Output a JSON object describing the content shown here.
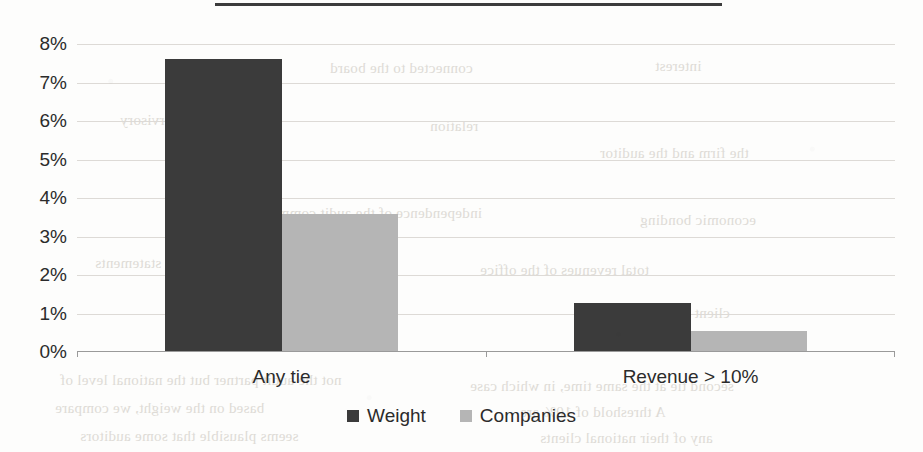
{
  "page": {
    "background_color": "#fdfdfc",
    "top_rule_color": "#3c3c3c"
  },
  "bleed_through": [
    {
      "text": "connected to the board",
      "x": 330,
      "y": 60
    },
    {
      "text": "interest",
      "x": 655,
      "y": 58
    },
    {
      "text": "supervisory",
      "x": 120,
      "y": 112
    },
    {
      "text": "relation",
      "x": 430,
      "y": 118
    },
    {
      "text": "the firm and the auditor",
      "x": 600,
      "y": 145
    },
    {
      "text": "independence of the audit committee",
      "x": 250,
      "y": 205
    },
    {
      "text": "economic bonding",
      "x": 640,
      "y": 212
    },
    {
      "text": "financial statements",
      "x": 95,
      "y": 255
    },
    {
      "text": "total revenues of the office",
      "x": 480,
      "y": 262
    },
    {
      "text": "fee dependence measures",
      "x": 180,
      "y": 300
    },
    {
      "text": "client importance",
      "x": 620,
      "y": 305
    },
    {
      "text": "not the audit partner but the national level of",
      "x": 60,
      "y": 372
    },
    {
      "text": "second tie at the same time, in which case",
      "x": 470,
      "y": 378
    },
    {
      "text": "based on the weight, we compare",
      "x": 55,
      "y": 400
    },
    {
      "text": "A threshold of 10% are",
      "x": 520,
      "y": 404
    },
    {
      "text": "seems plausible that some auditors",
      "x": 80,
      "y": 428
    },
    {
      "text": "any of their national clients",
      "x": 540,
      "y": 430
    }
  ],
  "chart_data": {
    "type": "bar",
    "title": "",
    "xlabel": "",
    "ylabel": "",
    "categories": [
      "Any tie",
      "Revenue > 10%"
    ],
    "series": [
      {
        "name": "Weight",
        "color": "#3b3b3b",
        "values": [
          7.58,
          1.25
        ]
      },
      {
        "name": "Companies",
        "color": "#b5b5b5",
        "values": [
          3.55,
          0.52
        ]
      }
    ],
    "ylim": [
      0,
      8
    ],
    "ytick_step": 1,
    "ytick_labels": [
      "0%",
      "1%",
      "2%",
      "3%",
      "4%",
      "5%",
      "6%",
      "7%",
      "8%"
    ],
    "value_format": "percent",
    "grid": true,
    "grid_color": "#dddad6",
    "legend_position": "bottom",
    "legend": [
      "Weight",
      "Companies"
    ]
  }
}
